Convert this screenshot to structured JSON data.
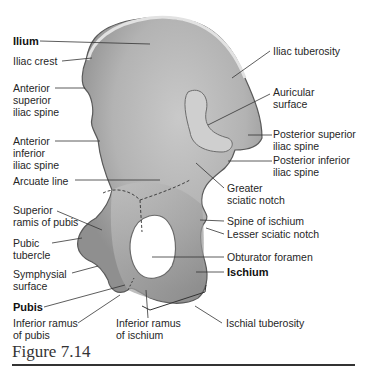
{
  "diagram": {
    "labels_left": [
      {
        "id": "ilium",
        "lines": [
          "Ilium"
        ],
        "bold": true
      },
      {
        "id": "iliac-crest",
        "lines": [
          "Iliac crest"
        ],
        "bold": false
      },
      {
        "id": "asis",
        "lines": [
          "Anterior",
          "superior",
          "iliac spine"
        ],
        "bold": false
      },
      {
        "id": "aiis",
        "lines": [
          "Anterior",
          "inferior",
          "iliac spine"
        ],
        "bold": false
      },
      {
        "id": "arcuate-line",
        "lines": [
          "Arcuate line"
        ],
        "bold": false
      },
      {
        "id": "superior-ramus-pubis",
        "lines": [
          "Superior",
          "ramis of pubis"
        ],
        "bold": false
      },
      {
        "id": "pubic-tubercle",
        "lines": [
          "Pubic",
          "tubercle"
        ],
        "bold": false
      },
      {
        "id": "symphysial-surface",
        "lines": [
          "Symphysial",
          "surface"
        ],
        "bold": false
      },
      {
        "id": "pubis",
        "lines": [
          "Pubis"
        ],
        "bold": true
      },
      {
        "id": "inferior-ramus-pubis",
        "lines": [
          "Inferior ramus",
          "of pubis"
        ],
        "bold": false
      }
    ],
    "labels_right": [
      {
        "id": "iliac-tuberosity",
        "lines": [
          "Iliac tuberosity"
        ],
        "bold": false
      },
      {
        "id": "auricular-surface",
        "lines": [
          "Auricular",
          "surface"
        ],
        "bold": false
      },
      {
        "id": "psis",
        "lines": [
          "Posterior superior",
          "iliac spine"
        ],
        "bold": false
      },
      {
        "id": "piis",
        "lines": [
          "Posterior inferior",
          "iliac spine"
        ],
        "bold": false
      },
      {
        "id": "greater-sciatic-notch",
        "lines": [
          "Greater",
          "sciatic notch"
        ],
        "bold": false
      },
      {
        "id": "spine-ischium",
        "lines": [
          "Spine of ischium"
        ],
        "bold": false
      },
      {
        "id": "lesser-sciatic-notch",
        "lines": [
          "Lesser sciatic notch"
        ],
        "bold": false
      },
      {
        "id": "obturator-foramen",
        "lines": [
          "Obturator foramen"
        ],
        "bold": false
      },
      {
        "id": "ischium",
        "lines": [
          "Ischium"
        ],
        "bold": true
      },
      {
        "id": "ischial-tuberosity",
        "lines": [
          "Ischial tuberosity"
        ],
        "bold": false
      }
    ],
    "labels_bottom": [
      {
        "id": "inferior-ramus-ischium",
        "lines": [
          "Inferior ramus",
          "of ischium"
        ],
        "bold": false
      }
    ]
  },
  "caption": {
    "text": "Figure 7.14"
  },
  "colors": {
    "bone_fill": "#b8b8b8",
    "bone_shade": "#8c8c8c",
    "bone_light": "#dcdcdc",
    "leader_line": "#333333",
    "text": "#262626"
  }
}
